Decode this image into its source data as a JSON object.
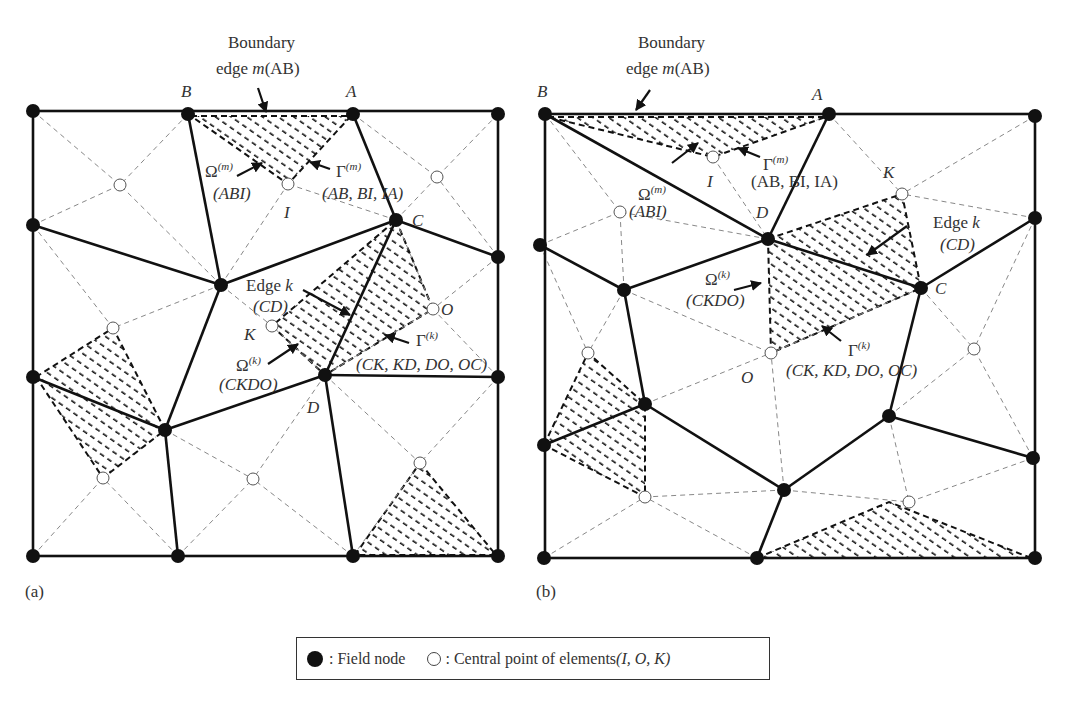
{
  "figure": {
    "panel_a": {
      "tag": "(a)",
      "title_line1": "Boundary",
      "title_line2_prefix": "edge ",
      "title_line2_var": "m",
      "title_line2_suffix": "(AB)",
      "node_labels": {
        "B": "B",
        "A": "A",
        "C": "C",
        "D": "D",
        "I": "I",
        "K": "K",
        "O": "O"
      },
      "omega_m": "Ω",
      "omega_m_sup": "(m)",
      "omega_m_sub": "(ABI)",
      "gamma_m": "Γ",
      "gamma_m_sup": "(m)",
      "gamma_m_sub": "(AB, BI, IA)",
      "edge_k_line1": "Edge k",
      "edge_k_line2": "(CD)",
      "omega_k": "Ω",
      "omega_k_sup": "(k)",
      "omega_k_sub": "(CKDO)",
      "gamma_k": "Γ",
      "gamma_k_sup": "(k)",
      "gamma_k_sub": "(CK, KD, DO, OC)"
    },
    "panel_b": {
      "tag": "(b)",
      "title_line1": "Boundary",
      "title_line2_prefix": "edge ",
      "title_line2_var": "m",
      "title_line2_suffix": "(AB)",
      "node_labels": {
        "B": "B",
        "A": "A",
        "C": "C",
        "D": "D",
        "I": "I",
        "K": "K",
        "O": "O"
      },
      "omega_m": "Ω",
      "omega_m_sup": "(m)",
      "omega_m_sub": "(ABI)",
      "gamma_m": "Γ",
      "gamma_m_sup": "(m)",
      "gamma_m_sub": "(AB, BI, IA)",
      "edge_k_line1": "Edge k",
      "edge_k_line2": "(CD)",
      "omega_k": "Ω",
      "omega_k_sup": "(k)",
      "omega_k_sub": "(CKDO)",
      "gamma_k": "Γ",
      "gamma_k_sup": "(k)",
      "gamma_k_sub": "(CK, KD, DO, OC)"
    },
    "legend": {
      "field_node_icon": "filled-circle",
      "field_node_label": ": Field node",
      "central_point_icon": "hollow-circle",
      "central_point_label": ": Central point of elements ",
      "central_point_vars": "(I, O, K)"
    },
    "colors": {
      "solid_edge": "#111111",
      "dashed_edge": "#888888",
      "hatch": "#111111",
      "node": "#111111"
    }
  }
}
